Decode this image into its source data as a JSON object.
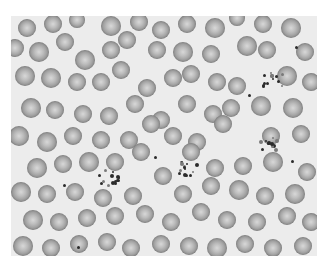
{
  "image": {
    "description": "Grayscale light-microscopy image of a peripheral blood smear showing numerous red blood cells and several platelet clumps",
    "frame": {
      "x": 11,
      "y": 16,
      "width": 306,
      "height": 240
    },
    "colors": {
      "background": "#ffffff",
      "plasma": "#ececec",
      "cell_edge": "#7a7a7a",
      "cell_center": "#d8d8d8",
      "platelet": "#2b2b2b"
    }
  },
  "cells": [
    [
      16,
      12,
      9
    ],
    [
      42,
      8,
      9
    ],
    [
      66,
      4,
      8
    ],
    [
      100,
      10,
      10
    ],
    [
      128,
      6,
      9
    ],
    [
      150,
      14,
      9
    ],
    [
      176,
      8,
      9
    ],
    [
      204,
      12,
      10
    ],
    [
      226,
      2,
      8
    ],
    [
      252,
      8,
      9
    ],
    [
      280,
      12,
      10
    ],
    [
      4,
      32,
      9
    ],
    [
      28,
      36,
      10
    ],
    [
      54,
      26,
      9
    ],
    [
      74,
      44,
      10
    ],
    [
      100,
      34,
      9
    ],
    [
      116,
      24,
      9
    ],
    [
      146,
      34,
      9
    ],
    [
      172,
      36,
      10
    ],
    [
      200,
      38,
      9
    ],
    [
      236,
      30,
      10
    ],
    [
      256,
      34,
      9
    ],
    [
      294,
      36,
      9
    ],
    [
      14,
      60,
      10
    ],
    [
      40,
      62,
      10
    ],
    [
      66,
      66,
      9
    ],
    [
      90,
      66,
      9
    ],
    [
      110,
      54,
      9
    ],
    [
      136,
      72,
      9
    ],
    [
      162,
      62,
      9
    ],
    [
      180,
      58,
      9
    ],
    [
      206,
      66,
      9
    ],
    [
      226,
      70,
      9
    ],
    [
      276,
      60,
      10
    ],
    [
      300,
      66,
      9
    ],
    [
      20,
      92,
      10
    ],
    [
      44,
      94,
      9
    ],
    [
      72,
      98,
      9
    ],
    [
      98,
      100,
      9
    ],
    [
      124,
      88,
      9
    ],
    [
      150,
      104,
      9
    ],
    [
      176,
      88,
      9
    ],
    [
      202,
      98,
      9
    ],
    [
      220,
      92,
      9
    ],
    [
      250,
      90,
      10
    ],
    [
      282,
      92,
      10
    ],
    [
      8,
      120,
      10
    ],
    [
      36,
      126,
      10
    ],
    [
      62,
      120,
      9
    ],
    [
      90,
      124,
      9
    ],
    [
      118,
      124,
      9
    ],
    [
      140,
      108,
      9
    ],
    [
      162,
      120,
      9
    ],
    [
      186,
      126,
      9
    ],
    [
      212,
      108,
      9
    ],
    [
      260,
      120,
      9
    ],
    [
      290,
      118,
      9
    ],
    [
      26,
      152,
      10
    ],
    [
      52,
      148,
      9
    ],
    [
      78,
      146,
      10
    ],
    [
      104,
      146,
      9
    ],
    [
      130,
      136,
      9
    ],
    [
      152,
      160,
      9
    ],
    [
      180,
      136,
      9
    ],
    [
      204,
      152,
      9
    ],
    [
      232,
      150,
      9
    ],
    [
      262,
      146,
      10
    ],
    [
      296,
      156,
      9
    ],
    [
      10,
      176,
      10
    ],
    [
      36,
      178,
      9
    ],
    [
      64,
      176,
      9
    ],
    [
      92,
      182,
      9
    ],
    [
      122,
      180,
      9
    ],
    [
      172,
      178,
      9
    ],
    [
      200,
      170,
      9
    ],
    [
      228,
      174,
      10
    ],
    [
      254,
      180,
      9
    ],
    [
      284,
      178,
      10
    ],
    [
      22,
      204,
      10
    ],
    [
      48,
      206,
      9
    ],
    [
      76,
      202,
      9
    ],
    [
      104,
      200,
      9
    ],
    [
      134,
      198,
      9
    ],
    [
      160,
      206,
      9
    ],
    [
      190,
      196,
      9
    ],
    [
      216,
      204,
      9
    ],
    [
      246,
      206,
      9
    ],
    [
      276,
      200,
      9
    ],
    [
      300,
      206,
      9
    ],
    [
      12,
      230,
      10
    ],
    [
      40,
      232,
      9
    ],
    [
      68,
      228,
      9
    ],
    [
      96,
      226,
      9
    ],
    [
      120,
      232,
      9
    ],
    [
      150,
      228,
      9
    ],
    [
      178,
      230,
      9
    ],
    [
      206,
      232,
      10
    ],
    [
      234,
      228,
      9
    ],
    [
      262,
      232,
      9
    ],
    [
      292,
      230,
      9
    ]
  ],
  "platelet_clusters": [
    {
      "cx": 260,
      "cy": 62,
      "count": 14,
      "spread": 11
    },
    {
      "cx": 257,
      "cy": 126,
      "count": 12,
      "spread": 9
    },
    {
      "cx": 177,
      "cy": 152,
      "count": 14,
      "spread": 10
    },
    {
      "cx": 97,
      "cy": 160,
      "count": 14,
      "spread": 11
    }
  ],
  "single_platelets": [
    [
      284,
      30
    ],
    [
      237,
      78
    ],
    [
      143,
      140
    ],
    [
      52,
      168
    ],
    [
      66,
      230
    ],
    [
      280,
      144
    ]
  ]
}
